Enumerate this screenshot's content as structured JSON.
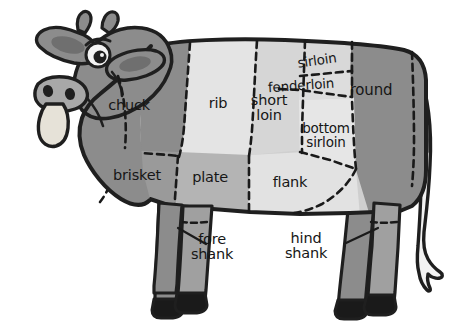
{
  "diagram": {
    "background_color": "#ffffff",
    "outline_color": "#1f1f1f",
    "colors": {
      "dark_gray": "#8c8c8c",
      "medium_gray": "#a8a8a8",
      "light_gray": "#d2d2d2",
      "very_light_gray": "#e4e4e4",
      "hoof_black": "#1a1a1a",
      "ear_inner": "#6f6f6f",
      "eye_white": "#f4f4f4",
      "tongue": "#e6e2d8"
    },
    "cuts": [
      {
        "id": "chuck",
        "label": "chuck",
        "x": 129,
        "y": 106,
        "size": 14.5,
        "rotate": 0,
        "shade": "dark_gray"
      },
      {
        "id": "rib",
        "label": "rib",
        "x": 218,
        "y": 104,
        "size": 14.5,
        "rotate": 0,
        "shade": "very_light_gray"
      },
      {
        "id": "short-loin",
        "label": "short\nloin",
        "x": 269,
        "y": 108,
        "size": 14.5,
        "rotate": 0,
        "shade": "light_gray"
      },
      {
        "id": "sirloin",
        "label": "sirloin",
        "x": 317,
        "y": 60,
        "size": 13.5,
        "rotate": -8,
        "shade": "light_gray"
      },
      {
        "id": "tenderloin",
        "label": "fenderloin",
        "x": 301,
        "y": 85,
        "size": 13.5,
        "rotate": -4,
        "shade": "light_gray"
      },
      {
        "id": "bottom-sirloin",
        "label": "bottom\nsirloin",
        "x": 326,
        "y": 135,
        "size": 13.5,
        "rotate": 0,
        "shade": "very_light_gray"
      },
      {
        "id": "round",
        "label": "round",
        "x": 371,
        "y": 91,
        "size": 15,
        "rotate": 0,
        "shade": "dark_gray"
      },
      {
        "id": "brisket",
        "label": "brisket",
        "x": 137,
        "y": 176,
        "size": 14.5,
        "rotate": 0,
        "shade": "dark_gray"
      },
      {
        "id": "plate",
        "label": "plate",
        "x": 210,
        "y": 178,
        "size": 14.5,
        "rotate": 0,
        "shade": "medium_gray"
      },
      {
        "id": "flank",
        "label": "flank",
        "x": 290,
        "y": 183,
        "size": 14.5,
        "rotate": 0,
        "shade": "very_light_gray"
      },
      {
        "id": "fore-shank",
        "label": "fore\nshank",
        "x": 212,
        "y": 237,
        "size": 14.5,
        "rotate": 0,
        "shade": "dark_gray"
      },
      {
        "id": "hind-shank",
        "label": "hind\nshank",
        "x": 305,
        "y": 235,
        "size": 14.5,
        "rotate": 0,
        "shade": "dark_gray"
      }
    ],
    "leader_lines": [
      {
        "id": "fore-shank-leader",
        "x1": 175,
        "y1": 229,
        "x2": 205,
        "y2": 245
      },
      {
        "id": "hind-shank-leader",
        "x1": 379,
        "y1": 229,
        "x2": 347,
        "y2": 244
      }
    ]
  }
}
